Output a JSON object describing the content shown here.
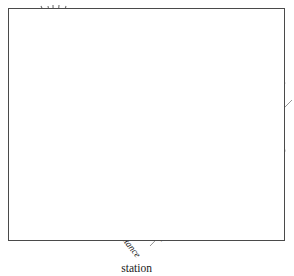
{
  "figure": {
    "background_color": "#ffffff",
    "border_color": "#4a4a4a",
    "ink_color": "#1a1a1a",
    "line_color": "#8a8a8a",
    "silhouette_color": "#d9d9d9",
    "tree_color": "#9a9a9a"
  },
  "labels": {
    "sight_line": "Sight line",
    "object_line1": "Object to",
    "object_line2": "be located",
    "measured_distance_1": "Measured distance",
    "base_line": "Base line",
    "right_angle": "90°",
    "station_line1": "Base line",
    "station_line2": "station",
    "measured_distance_2_line1": "Measured",
    "measured_distance_2_line2": "distance"
  },
  "elements": {
    "tree": "tree-object",
    "surveyor": "surveyor-silhouette",
    "tape_loop": "measuring-tape-loop",
    "station_marker": "base-line-station-marker",
    "right_angle_arc": "right-angle-arc",
    "sight_line_style": "dashed"
  }
}
